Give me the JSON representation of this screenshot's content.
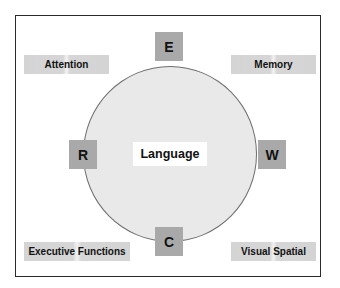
{
  "diagram": {
    "center": {
      "label": "Language"
    },
    "letters": [
      {
        "id": "top",
        "label": "E"
      },
      {
        "id": "left",
        "label": "R"
      },
      {
        "id": "right",
        "label": "W"
      },
      {
        "id": "bottom",
        "label": "C"
      }
    ],
    "corners": [
      {
        "id": "top-left",
        "label": "Attention"
      },
      {
        "id": "top-right",
        "label": "Memory"
      },
      {
        "id": "bottom-left",
        "label": "Executive Functions"
      },
      {
        "id": "bottom-right",
        "label": "Visual Spatial"
      }
    ],
    "colors": {
      "frame_border": "#2a2a2a",
      "circle_fill": "#e9e9e9",
      "circle_stroke": "#6f6f6f",
      "letter_box_fill": "#a9a9a9",
      "corner_label_fill": "#d4d4d4",
      "text": "#111111"
    }
  }
}
